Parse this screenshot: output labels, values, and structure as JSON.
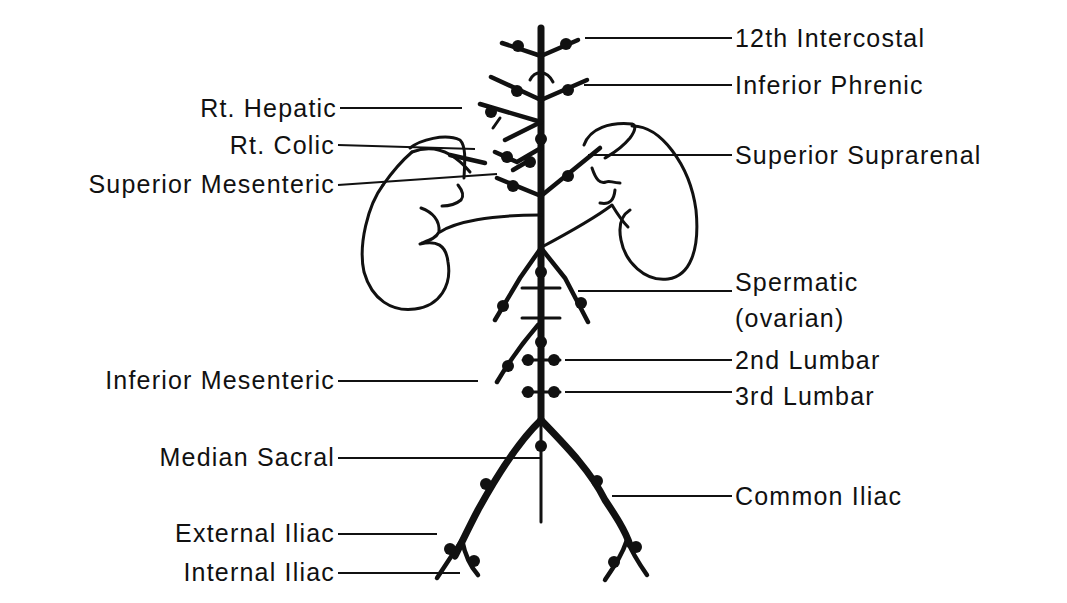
{
  "diagram": {
    "labels_left": [
      {
        "id": "rt_hepatic",
        "text": "Rt. Hepatic"
      },
      {
        "id": "rt_colic",
        "text": "Rt. Colic"
      },
      {
        "id": "superior_mesenteric",
        "text": "Superior Mesenteric"
      },
      {
        "id": "inferior_mesenteric",
        "text": "Inferior Mesenteric"
      },
      {
        "id": "median_sacral",
        "text": "Median Sacral"
      },
      {
        "id": "external_iliac",
        "text": "External Iliac"
      },
      {
        "id": "internal_iliac",
        "text": "Internal Iliac"
      }
    ],
    "labels_right": [
      {
        "id": "intercostal_12th",
        "text": "12th Intercostal"
      },
      {
        "id": "inferior_phrenic",
        "text": "Inferior Phrenic"
      },
      {
        "id": "superior_suprarenal",
        "text": "Superior Suprarenal"
      },
      {
        "id": "spermatic",
        "text": "Spermatic"
      },
      {
        "id": "ovarian",
        "text": "(ovarian)"
      },
      {
        "id": "lumbar_2nd",
        "text": "2nd Lumbar"
      },
      {
        "id": "lumbar_3rd",
        "text": "3rd Lumbar"
      },
      {
        "id": "common_iliac",
        "text": "Common Iliac"
      }
    ],
    "colors": {
      "ink": "#111111",
      "background": "#ffffff"
    }
  }
}
